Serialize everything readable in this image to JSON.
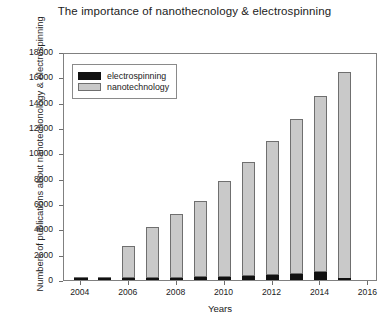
{
  "chart_data": {
    "type": "bar",
    "subtype": "stacked-bar",
    "title": "The importance of nanothecnology & electrospinning",
    "xlabel": "Years",
    "ylabel": "Numbers of publications about nanotechonology & electrospinning",
    "categories": [
      2004,
      2005,
      2006,
      2007,
      2008,
      2009,
      2010,
      2011,
      2012,
      2013,
      2014,
      2015
    ],
    "series": [
      {
        "name": "electrospinning",
        "color": "#111111",
        "values": [
          30,
          60,
          120,
          150,
          180,
          200,
          230,
          300,
          380,
          450,
          620,
          80
        ]
      },
      {
        "name": "nanotechnology",
        "color": "#c9c9c9",
        "values": [
          20,
          40,
          2580,
          4050,
          5070,
          6050,
          7550,
          9000,
          10620,
          12250,
          13880,
          16320
        ]
      }
    ],
    "totals": [
      50,
      100,
      2700,
      4200,
      5250,
      6250,
      7780,
      9300,
      11000,
      12700,
      14500,
      16400
    ],
    "ylim": [
      0,
      18000
    ],
    "yticks": [
      0,
      2000,
      4000,
      6000,
      8000,
      10000,
      12000,
      14000,
      16000,
      18000
    ],
    "ytick_labels": [
      "0",
      "2000",
      "4000",
      "6000",
      "8000",
      "10000",
      "12000",
      "14000",
      "16000",
      "18000"
    ],
    "xlim": [
      2003.3,
      2016.4
    ],
    "xticks": [
      2004,
      2006,
      2008,
      2010,
      2012,
      2014,
      2016
    ],
    "xtick_labels": [
      "2004",
      "2006",
      "2008",
      "2010",
      "2012",
      "2014",
      "2016"
    ],
    "grid": false,
    "legend_position": "upper left",
    "legend_entries": [
      "electrospinning",
      "nanotechnology"
    ],
    "bar_edge_color": "#6f6f6f",
    "frame_color": "#808080"
  }
}
